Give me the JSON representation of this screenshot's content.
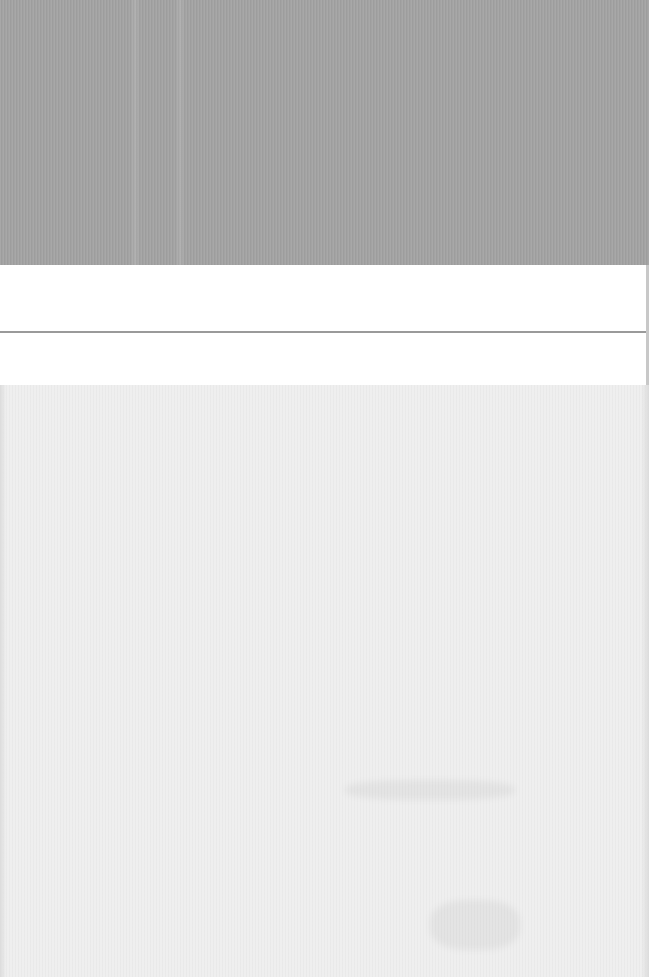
{
  "screen": {
    "description": "Washed-out/blank capture with no legible text",
    "regions": [
      {
        "name": "top-gray-band",
        "color": "#a3a3a3"
      },
      {
        "name": "row-1",
        "color": "#ffffff",
        "text": ""
      },
      {
        "name": "row-2",
        "color": "#ffffff",
        "text": ""
      },
      {
        "name": "bottom-light-area",
        "color": "#efefef"
      }
    ],
    "divider_color": "#9a9a9a"
  },
  "rows": [
    {
      "label": ""
    },
    {
      "label": ""
    }
  ]
}
